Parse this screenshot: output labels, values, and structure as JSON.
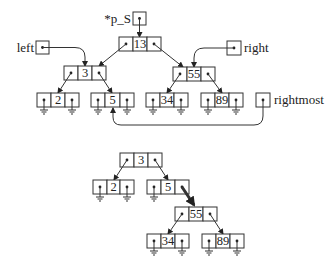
{
  "labels": {
    "p_S": "*p_S",
    "left": "left",
    "right": "right",
    "rightmost": "rightmost"
  },
  "tree_top": {
    "root": "13",
    "left": "3",
    "right": "55",
    "left_left": "2",
    "left_right": "5",
    "right_left": "34",
    "right_right": "89"
  },
  "tree_bottom": {
    "root": "3",
    "left": "2",
    "right": "5",
    "right_right": "55",
    "right_right_left": "34",
    "right_right_right": "89"
  },
  "colors": {
    "stroke": "#333333",
    "background": "#ffffff"
  }
}
